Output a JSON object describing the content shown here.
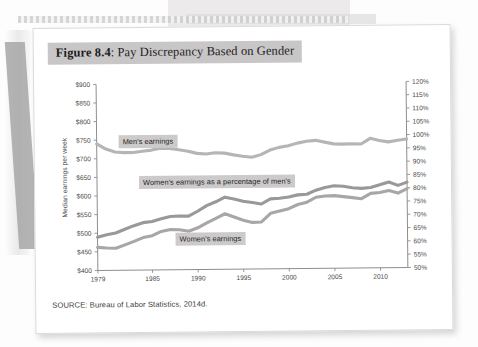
{
  "figure": {
    "number_label": "Figure 8.4",
    "separator": ": ",
    "title_text": "Pay Discrepancy Based on Gender",
    "full_title": "Figure 8.4: Pay Discrepancy Based on Gender",
    "source_note": "SOURCE: Bureau of Labor Statistics, 2014d."
  },
  "colors": {
    "title_highlight": "#c8c6c6",
    "label_highlight": "#cccaca",
    "series_mens": "#b6b4b4",
    "series_percent": "#9a9898",
    "series_womens": "#a8a6a6",
    "axis": "#8f8d8d",
    "page": "#ffffff"
  },
  "chart_data": {
    "type": "line",
    "title": "Figure 8.4: Pay Discrepancy Based on Gender",
    "xlabel": "",
    "ylabel": "Median earnings per week",
    "y2label": "",
    "xlim": [
      1979,
      2013
    ],
    "ylim": [
      400,
      900
    ],
    "y2lim": [
      50,
      120
    ],
    "grid": false,
    "legend": "inline-labels",
    "x_tick_labels": [
      "1979",
      "1985",
      "1990",
      "1995",
      "2000",
      "2005",
      "2010"
    ],
    "x_ticks": [
      1979,
      1985,
      1990,
      1995,
      2000,
      2005,
      2010
    ],
    "y_tick_labels": [
      "$900",
      "$850",
      "$800",
      "$750",
      "$700",
      "$650",
      "$600",
      "$550",
      "$500",
      "$450",
      "$400"
    ],
    "y_ticks": [
      900,
      850,
      800,
      750,
      700,
      650,
      600,
      550,
      500,
      450,
      400
    ],
    "y2_tick_labels": [
      "120%",
      "115%",
      "110%",
      "105%",
      "100%",
      "95%",
      "90%",
      "85%",
      "80%",
      "75%",
      "70%",
      "65%",
      "60%",
      "55%",
      "50%"
    ],
    "y2_ticks": [
      120,
      115,
      110,
      105,
      100,
      95,
      90,
      85,
      80,
      75,
      70,
      65,
      60,
      55,
      50
    ],
    "x": [
      1979,
      1980,
      1981,
      1982,
      1983,
      1984,
      1985,
      1986,
      1987,
      1988,
      1989,
      1990,
      1991,
      1992,
      1993,
      1994,
      1995,
      1996,
      1997,
      1998,
      1999,
      2000,
      2001,
      2002,
      2003,
      2004,
      2005,
      2006,
      2007,
      2008,
      2009,
      2010,
      2011,
      2012,
      2013
    ],
    "series": [
      {
        "name": "Men's earnings",
        "axis": "left",
        "unit": "dollars per week",
        "color": "#b6b4b4",
        "label_text": "Men's earnings",
        "values": [
          740,
          726,
          718,
          716,
          716,
          719,
          722,
          727,
          726,
          722,
          718,
          712,
          710,
          713,
          712,
          707,
          703,
          700,
          707,
          719,
          726,
          730,
          737,
          742,
          744,
          739,
          734,
          733,
          734,
          733,
          748,
          742,
          738,
          742,
          745
        ]
      },
      {
        "name": "Women's earnings as a percentage of men's",
        "axis": "right",
        "unit": "percent",
        "color": "#9a9898",
        "label_text": "Women's earnings as a percentage of men's",
        "values": [
          62.5,
          63.4,
          64.0,
          65.4,
          66.7,
          67.8,
          68.2,
          69.2,
          70.0,
          70.2,
          70.1,
          71.9,
          74.0,
          75.4,
          77.1,
          76.4,
          75.5,
          75.0,
          74.4,
          76.3,
          76.5,
          76.9,
          77.7,
          77.9,
          79.4,
          80.4,
          81.0,
          80.8,
          80.2,
          79.9,
          80.2,
          81.2,
          82.2,
          80.9,
          82.1
        ]
      },
      {
        "name": "Women's earnings",
        "axis": "left",
        "unit": "dollars per week",
        "color": "#a8a6a6",
        "label_text": "Women's earnings",
        "values": [
          462,
          460,
          459,
          468,
          477,
          487,
          492,
          503,
          508,
          507,
          503,
          512,
          525,
          537,
          549,
          540,
          531,
          525,
          526,
          549,
          555,
          561,
          572,
          578,
          591,
          594,
          595,
          592,
          589,
          586,
          600,
          602,
          607,
          600,
          612
        ]
      }
    ]
  },
  "plot_labels": {
    "mens": "Men's earnings",
    "percent": "Women's earnings as a percentage of men's",
    "womens": "Women's earnings"
  }
}
